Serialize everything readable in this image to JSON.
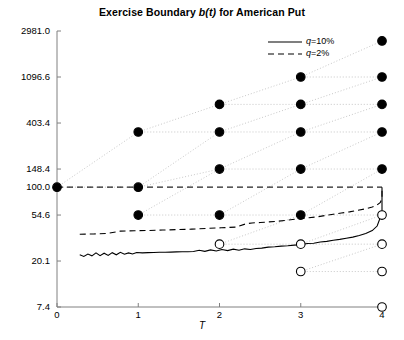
{
  "chart_data": {
    "type": "scatter",
    "title": "Exercise Boundary b(t) for American Put",
    "title_plain": "Exercise Boundary b(t) for American Put",
    "xlabel": "T",
    "ylabel": "",
    "yscale": "log",
    "xlim": [
      0,
      4
    ],
    "ylim": [
      7.4,
      2981.0
    ],
    "grid": false,
    "legend_position": "top-right",
    "xticks": [
      0,
      1,
      2,
      3,
      4
    ],
    "xtick_labels": [
      "0",
      "1",
      "2",
      "3",
      "4"
    ],
    "yticks": [
      7.4,
      20.1,
      54.6,
      100.0,
      148.4,
      403.4,
      1096.6,
      2981.0
    ],
    "ytick_labels": [
      "7.4",
      "20.1",
      "54.6",
      "100.0",
      "148.4",
      "403.4",
      "1096.6",
      "2981.0"
    ],
    "legend": [
      {
        "label": "q=10%",
        "style": "solid",
        "color": "#000000"
      },
      {
        "label": "q=2%",
        "style": "dashed",
        "color": "#000000"
      }
    ],
    "strike_level": 100.0,
    "lattice": {
      "description": "recombining binomial tree, nodes at T=0..4",
      "up_factor": 1.8221188,
      "filled_marker": "continuation-node",
      "open_marker": "exercise-node",
      "columns": [
        {
          "t": 0,
          "values": [
            100.0
          ],
          "filled": [
            true
          ]
        },
        {
          "t": 1,
          "values": [
            332.0,
            100.0,
            54.6
          ],
          "filled": [
            true,
            true,
            true
          ]
        },
        {
          "t": 2,
          "values": [
            605.0,
            332.0,
            148.4,
            54.6,
            29.0
          ],
          "filled": [
            true,
            true,
            true,
            true,
            false
          ]
        },
        {
          "t": 3,
          "values": [
            1096.6,
            605.0,
            332.0,
            148.4,
            54.6,
            29.0,
            16.0
          ],
          "filled": [
            true,
            true,
            true,
            true,
            true,
            false,
            false
          ]
        },
        {
          "t": 4,
          "values": [
            2400.0,
            1096.6,
            605.0,
            332.0,
            148.4,
            54.6,
            29.0,
            16.0,
            7.4
          ],
          "filled": [
            true,
            true,
            true,
            true,
            true,
            false,
            false,
            false,
            false
          ]
        }
      ]
    },
    "series": [
      {
        "name": "q=10%",
        "style": "solid",
        "x": [
          0.28,
          0.33,
          0.38,
          0.43,
          0.48,
          0.53,
          0.58,
          0.63,
          0.68,
          0.73,
          0.78,
          0.83,
          0.88,
          0.93,
          0.98,
          1.05,
          1.12,
          1.19,
          1.26,
          1.33,
          1.4,
          1.47,
          1.54,
          1.61,
          1.68,
          1.75,
          1.82,
          1.89,
          1.96,
          2.03,
          2.1,
          2.17,
          2.24,
          2.31,
          2.38,
          2.45,
          2.52,
          2.6,
          2.68,
          2.76,
          2.84,
          2.92,
          3.0,
          3.08,
          3.16,
          3.24,
          3.32,
          3.4,
          3.48,
          3.56,
          3.64,
          3.72,
          3.8,
          3.88,
          3.94,
          3.98,
          4.0,
          4.0
        ],
        "y": [
          23.0,
          22.2,
          23.4,
          22.5,
          24.0,
          22.6,
          23.8,
          22.7,
          24.1,
          23.0,
          24.3,
          23.3,
          24.0,
          23.4,
          24.2,
          24.0,
          24.1,
          24.2,
          24.3,
          24.3,
          24.4,
          24.5,
          24.6,
          24.6,
          24.7,
          25.4,
          24.8,
          25.6,
          25.0,
          25.8,
          25.2,
          26.0,
          25.4,
          26.2,
          25.8,
          26.4,
          26.6,
          27.2,
          27.4,
          27.8,
          28.0,
          28.4,
          28.6,
          29.4,
          29.6,
          30.4,
          30.8,
          31.6,
          32.2,
          33.0,
          33.8,
          35.0,
          36.5,
          39.0,
          43.0,
          52.0,
          54.6,
          100.0
        ]
      },
      {
        "name": "q=2%",
        "style": "dashed",
        "x": [
          0.28,
          0.45,
          0.62,
          0.78,
          0.95,
          1.12,
          1.3,
          1.48,
          1.66,
          1.84,
          2.02,
          2.2,
          2.32,
          2.4,
          2.5,
          2.6,
          2.7,
          2.8,
          2.9,
          3.0,
          3.1,
          3.2,
          3.3,
          3.4,
          3.5,
          3.6,
          3.7,
          3.8,
          3.88,
          3.94,
          3.98,
          4.0,
          4.0
        ],
        "y": [
          36.0,
          36.2,
          36.6,
          38.5,
          38.8,
          39.0,
          39.4,
          39.8,
          40.2,
          40.8,
          41.4,
          42.0,
          45.0,
          46.0,
          46.4,
          47.0,
          47.6,
          48.5,
          49.5,
          50.5,
          51.5,
          52.5,
          54.0,
          55.5,
          57.0,
          58.5,
          60.5,
          62.5,
          65.0,
          68.0,
          72.0,
          78.0,
          100.0
        ]
      }
    ]
  }
}
